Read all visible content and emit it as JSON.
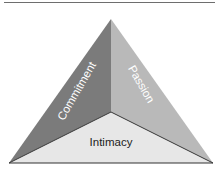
{
  "diagram": {
    "type": "triangle",
    "title": "",
    "faces": [
      {
        "id": "commitment",
        "label": "Commitment",
        "color": "#7b7b7b",
        "text_color": "#ffffff"
      },
      {
        "id": "passion",
        "label": "Passion",
        "color": "#b9b9b9",
        "text_color": "#ffffff"
      },
      {
        "id": "intimacy",
        "label": "Intimacy",
        "color": "#e7e7e7",
        "text_color": "#222222"
      }
    ],
    "edge_color": "#333333",
    "rule_color": "#6e6e6e"
  }
}
